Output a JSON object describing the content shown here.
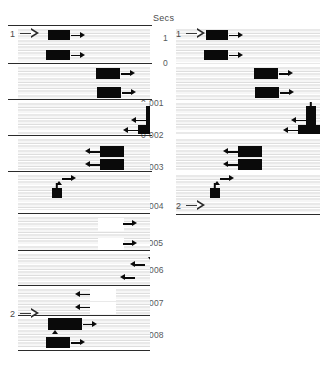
{
  "figure": {
    "axis_title": "Secs",
    "background": "#ffffff",
    "block_color": "#0a0a0a",
    "stripe_color": "#e9e9e9",
    "rule_color": "#2b2b2b",
    "label_color": "#55595c"
  },
  "time_axis": {
    "labels": [
      {
        "text": "1",
        "y": 33,
        "x": 163
      },
      {
        "text": "0",
        "y": 58,
        "x": 163
      },
      {
        "text": "0·001",
        "y": 98,
        "x": 141
      },
      {
        "text": "0·002",
        "y": 130,
        "x": 141
      },
      {
        "text": "0·003",
        "y": 162,
        "x": 141
      },
      {
        "text": "0·004",
        "y": 201,
        "x": 141
      },
      {
        "text": "0.005",
        "y": 238,
        "x": 141
      },
      {
        "text": "0·006",
        "y": 265,
        "x": 141
      },
      {
        "text": "0·007",
        "y": 298,
        "x": 141
      },
      {
        "text": "0·008",
        "y": 330,
        "x": 141
      }
    ]
  },
  "event_markers": [
    {
      "id": "marker-1-left",
      "number": "1",
      "x": 10,
      "y": 28
    },
    {
      "id": "marker-1-right",
      "number": "1",
      "x": 176,
      "y": 28
    },
    {
      "id": "marker-2-left",
      "number": "2",
      "x": 10,
      "y": 308
    },
    {
      "id": "marker-2-right",
      "number": "2",
      "x": 176,
      "y": 200
    }
  ],
  "columns": [
    {
      "name": "left-column",
      "x": 0,
      "width": 150,
      "bands": [
        {
          "name": "band-left-1",
          "y": 28,
          "height": 36,
          "traces": [
            {
              "kind": "block",
              "fill": "black",
              "x": 30,
              "y": 2,
              "w": 22,
              "h": 10,
              "arrow": "right"
            },
            {
              "kind": "block",
              "fill": "black",
              "x": 28,
              "y": 22,
              "w": 24,
              "h": 10,
              "arrow": "right"
            }
          ]
        },
        {
          "name": "band-left-2",
          "y": 66,
          "height": 34,
          "traces": [
            {
              "kind": "block",
              "fill": "black",
              "x": 78,
              "y": 2,
              "w": 24,
              "h": 11,
              "arrow": "right"
            },
            {
              "kind": "block",
              "fill": "black",
              "x": 79,
              "y": 21,
              "w": 24,
              "h": 11,
              "arrow": "right"
            }
          ]
        },
        {
          "name": "band-left-3",
          "y": 102,
          "height": 32,
          "traces": [
            {
              "kind": "flask",
              "x": 128,
              "y": 0,
              "w": 10,
              "h": 13
            },
            {
              "kind": "block",
              "fill": "black",
              "x": 128,
              "y": 13,
              "w": 10,
              "h": 10,
              "arrow": "left"
            },
            {
              "kind": "block",
              "fill": "black",
              "x": 120,
              "y": 23,
              "w": 24,
              "h": 10,
              "arrow": "left"
            }
          ]
        },
        {
          "name": "band-left-4",
          "y": 138,
          "height": 32,
          "traces": [
            {
              "kind": "block",
              "fill": "black",
              "x": 82,
              "y": 8,
              "w": 24,
              "h": 11,
              "arrow": "left"
            },
            {
              "kind": "block",
              "fill": "black",
              "x": 82,
              "y": 21,
              "w": 24,
              "h": 11,
              "arrow": "left"
            }
          ]
        },
        {
          "name": "band-left-5",
          "y": 174,
          "height": 36,
          "traces": [
            {
              "kind": "arrow-only",
              "x": 44,
              "y": 1,
              "arrow": "right"
            },
            {
              "kind": "tick-up",
              "x": 38,
              "y": 7
            },
            {
              "kind": "flask",
              "x": 34,
              "y": 9,
              "w": 10,
              "h": 15
            }
          ]
        },
        {
          "name": "band-left-6",
          "y": 216,
          "height": 34,
          "traces": [
            {
              "kind": "block",
              "fill": "white",
              "x": 80,
              "y": 2,
              "w": 24,
              "h": 11,
              "arrow": "right"
            },
            {
              "kind": "block",
              "fill": "white",
              "x": 80,
              "y": 22,
              "w": 24,
              "h": 11,
              "arrow": "right"
            }
          ]
        },
        {
          "name": "band-left-7",
          "y": 253,
          "height": 32,
          "traces": [
            {
              "kind": "tick-down",
              "x": 130,
              "y": 4
            },
            {
              "kind": "arrow-only",
              "x": 112,
              "y": 8,
              "arrow": "left"
            },
            {
              "kind": "arrow-only",
              "x": 102,
              "y": 21,
              "arrow": "left"
            }
          ]
        },
        {
          "name": "band-left-8",
          "y": 288,
          "height": 28,
          "traces": [
            {
              "kind": "block",
              "fill": "white",
              "x": 72,
              "y": 1,
              "w": 24,
              "h": 10,
              "arrow": "left"
            },
            {
              "kind": "block",
              "fill": "white",
              "x": 72,
              "y": 14,
              "w": 24,
              "h": 10,
              "arrow": "left"
            }
          ]
        },
        {
          "name": "band-left-9",
          "y": 318,
          "height": 30,
          "traces": [
            {
              "kind": "block",
              "fill": "black",
              "x": 30,
              "y": 0,
              "w": 34,
              "h": 12,
              "arrow": "right"
            },
            {
              "kind": "tick-up",
              "x": 34,
              "y": 12
            },
            {
              "kind": "block",
              "fill": "black",
              "x": 28,
              "y": 19,
              "w": 24,
              "h": 11,
              "arrow": "right"
            }
          ]
        }
      ]
    },
    {
      "name": "right-column",
      "x": 168,
      "width": 156,
      "bands": [
        {
          "name": "band-right-1",
          "y": 28,
          "height": 36,
          "traces": [
            {
              "kind": "block",
              "fill": "black",
              "x": 30,
              "y": 2,
              "w": 22,
              "h": 10,
              "arrow": "right"
            },
            {
              "kind": "block",
              "fill": "black",
              "x": 28,
              "y": 22,
              "w": 24,
              "h": 10,
              "arrow": "right"
            }
          ]
        },
        {
          "name": "band-right-2",
          "y": 66,
          "height": 34,
          "traces": [
            {
              "kind": "block",
              "fill": "black",
              "x": 78,
              "y": 2,
              "w": 24,
              "h": 11,
              "arrow": "right"
            },
            {
              "kind": "block",
              "fill": "black",
              "x": 79,
              "y": 21,
              "w": 24,
              "h": 11,
              "arrow": "right"
            }
          ]
        },
        {
          "name": "band-right-3",
          "y": 102,
          "height": 32,
          "traces": [
            {
              "kind": "flask",
              "x": 130,
              "y": 0,
              "w": 10,
              "h": 13
            },
            {
              "kind": "block",
              "fill": "black",
              "x": 130,
              "y": 13,
              "w": 10,
              "h": 10,
              "arrow": "left"
            },
            {
              "kind": "block",
              "fill": "black",
              "x": 122,
              "y": 23,
              "w": 24,
              "h": 10,
              "arrow": "left"
            }
          ]
        },
        {
          "name": "band-right-4",
          "y": 138,
          "height": 32,
          "traces": [
            {
              "kind": "block",
              "fill": "black",
              "x": 62,
              "y": 8,
              "w": 24,
              "h": 11,
              "arrow": "left"
            },
            {
              "kind": "block",
              "fill": "black",
              "x": 62,
              "y": 21,
              "w": 24,
              "h": 11,
              "arrow": "left"
            }
          ]
        },
        {
          "name": "band-right-5",
          "y": 174,
          "height": 38,
          "traces": [
            {
              "kind": "arrow-only",
              "x": 44,
              "y": 1,
              "arrow": "right"
            },
            {
              "kind": "tick-up",
              "x": 38,
              "y": 7
            },
            {
              "kind": "flask",
              "x": 34,
              "y": 9,
              "w": 10,
              "h": 15
            }
          ]
        }
      ]
    }
  ]
}
